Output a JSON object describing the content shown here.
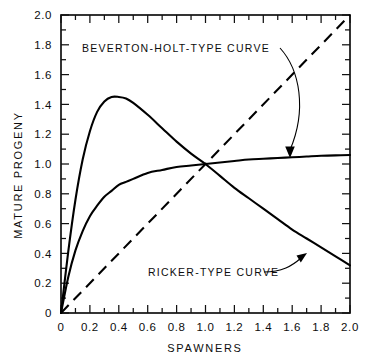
{
  "chart_data": {
    "type": "line",
    "title": "",
    "xlabel": "SPAWNERS",
    "ylabel": "MATURE PROGENY",
    "xlim": [
      0,
      2.0
    ],
    "ylim": [
      0,
      2.0
    ],
    "grid": false,
    "legend": "none",
    "xticks": [
      "0",
      "0.2",
      "0.4",
      "0.6",
      "0.8",
      "1.0",
      "1.2",
      "1.4",
      "1.6",
      "1.8",
      "2.0"
    ],
    "xtick_values": [
      0,
      0.2,
      0.4,
      0.6,
      0.8,
      1.0,
      1.2,
      1.4,
      1.6,
      1.8,
      2.0
    ],
    "yticks": [
      "0",
      "0.2",
      "0.4",
      "0.6",
      "0.8",
      "1.0",
      "1.2",
      "1.4",
      "1.6",
      "1.8",
      "2.0"
    ],
    "ytick_values": [
      0,
      0.2,
      0.4,
      0.6,
      0.8,
      1.0,
      1.2,
      1.4,
      1.6,
      1.8,
      2.0
    ],
    "x": [
      0,
      0.05,
      0.1,
      0.15,
      0.2,
      0.25,
      0.3,
      0.35,
      0.4,
      0.45,
      0.5,
      0.6,
      0.7,
      0.8,
      0.9,
      1.0,
      1.1,
      1.2,
      1.3,
      1.4,
      1.5,
      1.6,
      1.7,
      1.8,
      1.9,
      2.0
    ],
    "series": [
      {
        "name": "RICKER-TYPE CURVE",
        "style": "solid",
        "peak_x": 0.43,
        "peak_y": 1.45,
        "values": [
          0,
          0.41,
          0.76,
          1.03,
          1.22,
          1.35,
          1.42,
          1.45,
          1.45,
          1.44,
          1.41,
          1.33,
          1.24,
          1.15,
          1.07,
          1.0,
          0.92,
          0.84,
          0.77,
          0.7,
          0.63,
          0.56,
          0.5,
          0.44,
          0.38,
          0.32
        ]
      },
      {
        "name": "BEVERTON-HOLT-TYPE CURVE",
        "style": "solid",
        "asymptote": 1.12,
        "values": [
          0,
          0.24,
          0.42,
          0.55,
          0.65,
          0.72,
          0.78,
          0.82,
          0.86,
          0.88,
          0.9,
          0.94,
          0.96,
          0.98,
          0.99,
          1.0,
          1.01,
          1.02,
          1.03,
          1.035,
          1.04,
          1.045,
          1.05,
          1.055,
          1.058,
          1.06
        ]
      },
      {
        "name": "REPLACEMENT LINE",
        "style": "dashed",
        "values": [
          0,
          0.05,
          0.1,
          0.15,
          0.2,
          0.25,
          0.3,
          0.35,
          0.4,
          0.45,
          0.5,
          0.6,
          0.7,
          0.8,
          0.9,
          1.0,
          1.1,
          1.2,
          1.3,
          1.4,
          1.5,
          1.6,
          1.7,
          1.8,
          1.9,
          2.0
        ]
      }
    ],
    "annotations": [
      {
        "text": "BEVERTON-HOLT-TYPE CURVE",
        "text_x": 0.27,
        "text_y": 1.82,
        "points_to_x": 1.52,
        "points_to_y": 1.05
      },
      {
        "text": "RICKER-TYPE CURVE",
        "text_x": 0.62,
        "text_y": 0.42,
        "points_to_x": 1.68,
        "points_to_y": 0.49
      }
    ],
    "intersection_point": {
      "x": 1.0,
      "y": 1.0
    }
  }
}
